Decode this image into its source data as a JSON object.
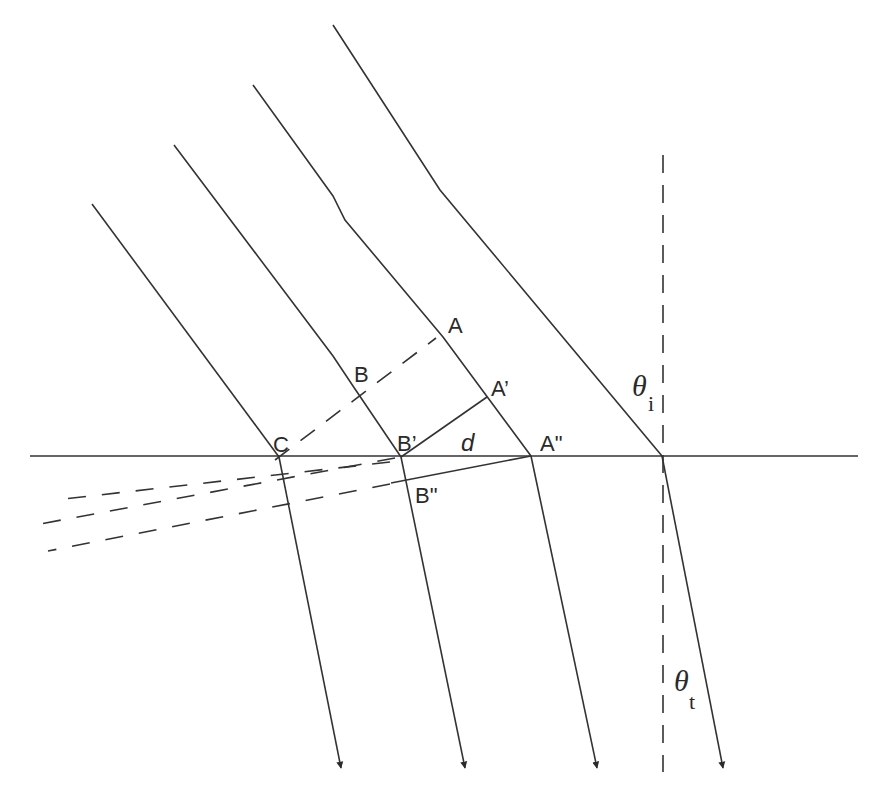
{
  "diagram": {
    "type": "refraction-wavefront",
    "colors": {
      "line": "#333333",
      "background": "#ffffff"
    },
    "labels": {
      "A": "A",
      "B": "B",
      "C": "C",
      "A_prime": "A’",
      "B_prime": "B’",
      "A_double_prime": "A\"",
      "B_double_prime": "B\"",
      "d": "d",
      "theta_i_symbol": "θ",
      "theta_i_sub": "i",
      "theta_t_symbol": "θ",
      "theta_t_sub": "t"
    },
    "interface": {
      "x1": 30,
      "y1": 456,
      "x2": 858,
      "y2": 456
    },
    "normal": {
      "x": 663,
      "y1": 155,
      "y2": 770
    }
  }
}
